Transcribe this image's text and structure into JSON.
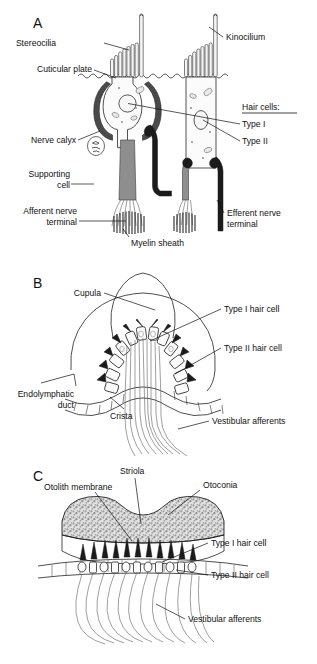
{
  "figure": {
    "background_color": "#ffffff",
    "ink_color": "#111111"
  },
  "panels": [
    {
      "id": "A",
      "letter": "A",
      "subject": "Type I and Type II vestibular hair cells",
      "labels": [
        {
          "key": "stereocilia",
          "text": "Stereocilia",
          "side": "left"
        },
        {
          "key": "cuticular_plate",
          "text": "Cuticular plate",
          "side": "left"
        },
        {
          "key": "nerve_calyx",
          "text": "Nerve calyx",
          "side": "left"
        },
        {
          "key": "supporting_cell_1",
          "text": "Supporting",
          "side": "left"
        },
        {
          "key": "supporting_cell_2",
          "text": "cell",
          "side": "left"
        },
        {
          "key": "afferent_1",
          "text": "Afferent nerve",
          "side": "left"
        },
        {
          "key": "afferent_2",
          "text": "terminal",
          "side": "left"
        },
        {
          "key": "myelin_sheath",
          "text": "Myelin sheath",
          "side": "bottom"
        },
        {
          "key": "kinocilium",
          "text": "Kinocilium",
          "side": "right"
        },
        {
          "key": "hair_cells_heading",
          "text": "Hair cells:",
          "side": "right"
        },
        {
          "key": "type_i",
          "text": "Type I",
          "side": "right"
        },
        {
          "key": "type_ii",
          "text": "Type II",
          "side": "right"
        },
        {
          "key": "efferent_1",
          "text": "Efferent nerve",
          "side": "right"
        },
        {
          "key": "efferent_2",
          "text": "terminal",
          "side": "right"
        }
      ]
    },
    {
      "id": "B",
      "letter": "B",
      "subject": "Crista ampullaris with cupula",
      "labels": [
        {
          "key": "cupula",
          "text": "Cupula",
          "side": "left"
        },
        {
          "key": "endolymphatic_1",
          "text": "Endolymphatic",
          "side": "left"
        },
        {
          "key": "endolymphatic_2",
          "text": "duct",
          "side": "left"
        },
        {
          "key": "crista",
          "text": "Crista",
          "side": "bottom"
        },
        {
          "key": "type_i_hair_cell",
          "text": "Type I hair cell",
          "side": "right"
        },
        {
          "key": "type_ii_hair_cell",
          "text": "Type II hair cell",
          "side": "right"
        },
        {
          "key": "vestibular_afferents",
          "text": "Vestibular afferents",
          "side": "right"
        }
      ]
    },
    {
      "id": "C",
      "letter": "C",
      "subject": "Otolith organ macula",
      "labels": [
        {
          "key": "striola",
          "text": "Striola",
          "side": "top"
        },
        {
          "key": "otolith_membrane",
          "text": "Otolith membrane",
          "side": "left"
        },
        {
          "key": "otoconia",
          "text": "Otoconia",
          "side": "right"
        },
        {
          "key": "type_i_hair_cell",
          "text": "Type I hair cell",
          "side": "right"
        },
        {
          "key": "type_ii_hair_cell",
          "text": "Type II hair cell",
          "side": "right"
        },
        {
          "key": "vestibular_afferents",
          "text": "Vestibular afferents",
          "side": "right"
        }
      ]
    }
  ],
  "panelA": {
    "letter": "A",
    "stereocilia": "Stereocilia",
    "cuticular_plate": "Cuticular plate",
    "nerve_calyx": "Nerve calyx",
    "supporting_cell_line1": "Supporting",
    "supporting_cell_line2": "cell",
    "afferent_line1": "Afferent nerve",
    "afferent_line2": "terminal",
    "myelin_sheath": "Myelin sheath",
    "kinocilium": "Kinocilium",
    "hair_cells_heading": "Hair cells:",
    "type_i": "Type I",
    "type_ii": "Type II",
    "efferent_line1": "Efferent nerve",
    "efferent_line2": "terminal"
  },
  "panelB": {
    "letter": "B",
    "cupula": "Cupula",
    "endolymphatic_line1": "Endolymphatic",
    "endolymphatic_line2": "duct",
    "crista": "Crista",
    "type_i_hair_cell": "Type I hair cell",
    "type_ii_hair_cell": "Type II hair cell",
    "vestibular_afferents": "Vestibular afferents"
  },
  "panelC": {
    "letter": "C",
    "striola": "Striola",
    "otolith_membrane": "Otolith membrane",
    "otoconia": "Otoconia",
    "type_i_hair_cell": "Type I hair cell",
    "type_ii_hair_cell": "Type II hair cell",
    "vestibular_afferents": "Vestibular afferents"
  }
}
